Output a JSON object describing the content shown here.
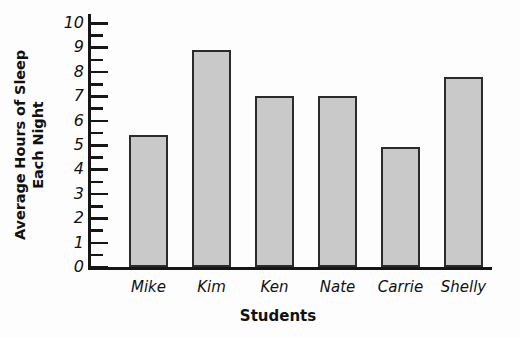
{
  "chart_data": {
    "type": "bar",
    "title": "",
    "categories": [
      "Mike",
      "Kim",
      "Ken",
      "Nate",
      "Carrie",
      "Shelly"
    ],
    "values": [
      5.4,
      8.9,
      7.0,
      7.0,
      4.9,
      7.8
    ],
    "xlabel": "Students",
    "ylabel": "Average Hours of Sleep Each Night",
    "ylabel_lines": [
      "Average Hours of Sleep",
      "Each Night"
    ],
    "ylim": [
      0,
      10
    ],
    "ytick_labels": [
      "0",
      "1",
      "2",
      "3",
      "4",
      "5",
      "6",
      "7",
      "8",
      "9",
      "10"
    ],
    "ytick_values": [
      0,
      1,
      2,
      3,
      4,
      5,
      6,
      7,
      8,
      9,
      10
    ],
    "minor_tick_step": 0.5,
    "grid": false,
    "legend": false,
    "bar_fill_color": "#c9c9c9",
    "bar_edge_color": "#2b2b2b",
    "axis_color": "#161616",
    "background_color": "#fdfdfd"
  }
}
